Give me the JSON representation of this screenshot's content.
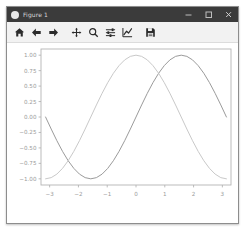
{
  "window": {
    "title": "Figure 1",
    "app_icon": "matplotlib-icon",
    "controls": {
      "minimize": "minimize-icon",
      "maximize": "maximize-icon",
      "close": "close-icon"
    }
  },
  "toolbar": {
    "buttons": [
      {
        "name": "home-button",
        "icon": "home-icon",
        "tooltip": "Reset original view"
      },
      {
        "name": "back-button",
        "icon": "arrow-left-icon",
        "tooltip": "Back to previous view"
      },
      {
        "name": "forward-button",
        "icon": "arrow-right-icon",
        "tooltip": "Forward to next view"
      },
      {
        "name": "pan-button",
        "icon": "move-icon",
        "tooltip": "Pan axes with left mouse, zoom with right"
      },
      {
        "name": "zoom-button",
        "icon": "magnifier-icon",
        "tooltip": "Zoom to rectangle"
      },
      {
        "name": "subplots-button",
        "icon": "sliders-icon",
        "tooltip": "Configure subplots"
      },
      {
        "name": "customize-button",
        "icon": "line-chart-icon",
        "tooltip": "Edit axis, curve and image parameters"
      },
      {
        "name": "save-button",
        "icon": "floppy-disk-icon",
        "tooltip": "Save the figure"
      }
    ]
  },
  "colors": {
    "titlebar_bg": "#3b3b3b",
    "title_fg": "#d8d8d8",
    "toolbar_bg": "#f2f2f2",
    "canvas_bg": "#ffffff",
    "axes_edge": "#b4b4b4",
    "tick_label": "#9a9a9a",
    "series_1": "#9b9b9b",
    "series_2": "#c9c9c9"
  },
  "chart_data": {
    "type": "line",
    "title": "",
    "xlabel": "",
    "ylabel": "",
    "xlim": [
      -3.3,
      3.3
    ],
    "ylim": [
      -1.1,
      1.1
    ],
    "grid": false,
    "legend": "none",
    "xticks": [
      -3,
      -2,
      -1,
      0,
      1,
      2,
      3
    ],
    "xticklabels": [
      "−3",
      "−2",
      "−1",
      "0",
      "1",
      "2",
      "3"
    ],
    "yticks": [
      1.0,
      0.75,
      0.5,
      0.25,
      0.0,
      -0.25,
      -0.5,
      -0.75,
      -1.0
    ],
    "yticklabels": [
      "1.00",
      "0.75",
      "0.50",
      "0.25",
      "0.00",
      "−0.25",
      "−0.50",
      "−0.75",
      "−1.00"
    ],
    "x": [
      -3.1416,
      -2.9452,
      -2.7489,
      -2.5525,
      -2.3562,
      -2.1598,
      -1.9635,
      -1.7671,
      -1.5708,
      -1.3744,
      -1.1781,
      -0.9817,
      -0.7854,
      -0.589,
      -0.3927,
      -0.1963,
      0,
      0.1963,
      0.3927,
      0.589,
      0.7854,
      0.9817,
      1.1781,
      1.3744,
      1.5708,
      1.7671,
      1.9635,
      2.1598,
      2.3562,
      2.5525,
      2.7489,
      2.9452,
      3.1416
    ],
    "series": [
      {
        "name": "sin(x)",
        "color": "#9b9b9b",
        "values": [
          0.0,
          -0.195,
          -0.383,
          -0.556,
          -0.707,
          -0.831,
          -0.924,
          -0.981,
          -1.0,
          -0.981,
          -0.924,
          -0.831,
          -0.707,
          -0.556,
          -0.383,
          -0.195,
          0.0,
          0.195,
          0.383,
          0.556,
          0.707,
          0.831,
          0.924,
          0.981,
          1.0,
          0.981,
          0.924,
          0.831,
          0.707,
          0.556,
          0.383,
          0.195,
          0.0
        ]
      },
      {
        "name": "cos(x)",
        "color": "#c9c9c9",
        "values": [
          -1.0,
          -0.981,
          -0.924,
          -0.831,
          -0.707,
          -0.556,
          -0.383,
          -0.195,
          0.0,
          0.195,
          0.383,
          0.556,
          0.707,
          0.831,
          0.924,
          0.981,
          1.0,
          0.981,
          0.924,
          0.831,
          0.707,
          0.556,
          0.383,
          0.195,
          0.0,
          -0.195,
          -0.383,
          -0.556,
          -0.707,
          -0.831,
          -0.924,
          -0.981,
          -1.0
        ]
      }
    ]
  }
}
